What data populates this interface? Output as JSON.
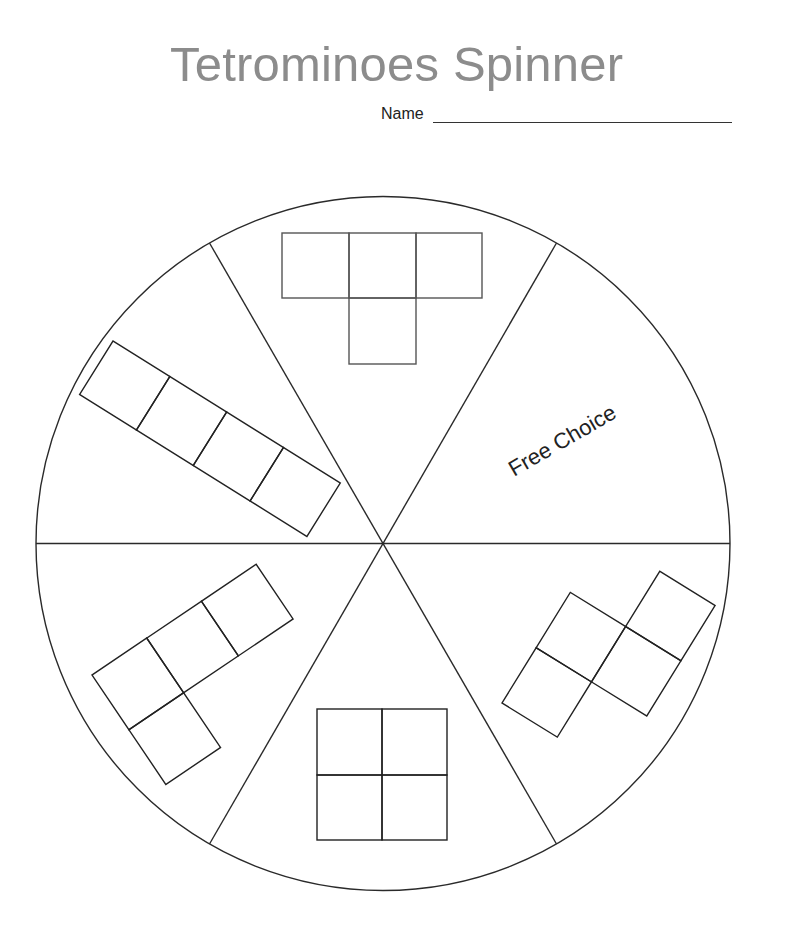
{
  "title": "Tetrominoes Spinner",
  "name_field": {
    "label": "Name",
    "value": ""
  },
  "spinner": {
    "center": [
      383,
      543.5
    ],
    "radius": 347,
    "stroke": "#2a2a2a",
    "divider_angles_deg": [
      0,
      60,
      120,
      180,
      240,
      300
    ],
    "sections": [
      {
        "id": "top",
        "type": "T-tetromino"
      },
      {
        "id": "top-right",
        "type": "free-choice",
        "label": "Free Choice"
      },
      {
        "id": "bottom-right",
        "type": "S-tetromino"
      },
      {
        "id": "bottom",
        "type": "O-tetromino"
      },
      {
        "id": "bottom-left",
        "type": "L-tetromino"
      },
      {
        "id": "top-left",
        "type": "I-tetromino"
      }
    ]
  },
  "free_choice_label": "Free Choice"
}
